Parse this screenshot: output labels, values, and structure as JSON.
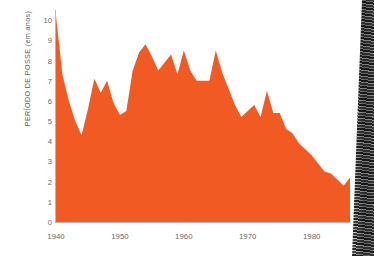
{
  "chart_data": {
    "type": "area",
    "title": "",
    "xlabel": "",
    "ylabel": "PERÍODO DE POSSE (em anos)",
    "ylim": [
      0,
      10.5
    ],
    "xlim": [
      1940,
      1986
    ],
    "grid": "vertical-decade-gridlines",
    "legend": "none",
    "series_color": "#F15A22",
    "yticks": [
      "0",
      "1",
      "2",
      "3",
      "4",
      "5",
      "6",
      "7",
      "8",
      "9",
      "10"
    ],
    "ytick_values": [
      0,
      1,
      2,
      3,
      4,
      5,
      6,
      7,
      8,
      9,
      10
    ],
    "xticks": [
      "1940",
      "1950",
      "1960",
      "1970",
      "1980"
    ],
    "xtick_values": [
      1940,
      1950,
      1960,
      1970,
      1980
    ],
    "x": [
      1940,
      1941,
      1942,
      1943,
      1944,
      1945,
      1946,
      1947,
      1948,
      1949,
      1950,
      1951,
      1952,
      1953,
      1954,
      1955,
      1956,
      1957,
      1958,
      1959,
      1960,
      1961,
      1962,
      1963,
      1964,
      1965,
      1966,
      1967,
      1968,
      1969,
      1970,
      1971,
      1972,
      1973,
      1974,
      1975,
      1976,
      1977,
      1978,
      1979,
      1980,
      1981,
      1982,
      1983,
      1984,
      1985,
      1986
    ],
    "values": [
      10.2,
      7.3,
      6.0,
      5.0,
      4.3,
      5.6,
      7.1,
      6.4,
      7.0,
      5.9,
      5.3,
      5.5,
      7.5,
      8.4,
      8.8,
      8.2,
      7.5,
      7.9,
      8.3,
      7.3,
      8.5,
      7.5,
      7.0,
      7.0,
      7.0,
      8.5,
      7.4,
      6.6,
      5.8,
      5.2,
      5.5,
      5.8,
      5.2,
      6.5,
      5.4,
      5.4,
      4.6,
      4.4,
      3.9,
      3.6,
      3.3,
      2.9,
      2.5,
      2.4,
      2.1,
      1.8,
      2.2
    ]
  },
  "axes": {
    "y_title": "PERÍODO DE POSSE (em anos)"
  }
}
